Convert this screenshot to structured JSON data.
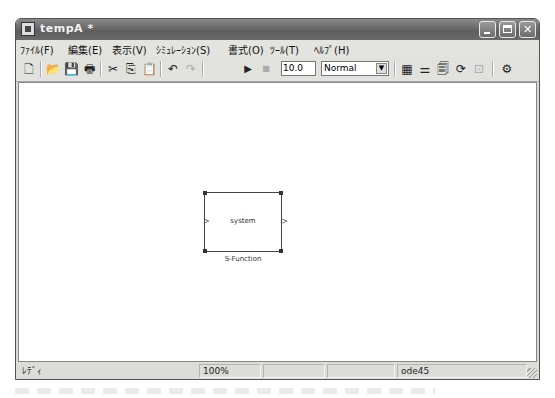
{
  "window": {
    "title": "tempA *",
    "controls": {
      "minimize": "_",
      "maximize": "□",
      "close": "✕"
    }
  },
  "menubar": {
    "items": [
      {
        "label": "ﾌｧｲﾙ(F)"
      },
      {
        "label": "編集(E)"
      },
      {
        "label": "表示(V)"
      },
      {
        "label": "ｼﾐｭﾚｰｼｮﾝ(S)"
      },
      {
        "label": "書式(O)"
      },
      {
        "label": "ﾂｰﾙ(T)"
      },
      {
        "label": "ﾍﾙﾌﾟ(H)"
      }
    ]
  },
  "toolbar": {
    "icons": {
      "new": "🗋",
      "open": "📂",
      "save": "💾",
      "print": "🖶",
      "cut": "✂",
      "copy": "⎘",
      "paste": "📋",
      "undo": "↶",
      "redo": "↷",
      "start": "▶",
      "stop": "■",
      "library": "▦",
      "model_browser": "⚌",
      "debug": "🗐",
      "update": "⟳",
      "build": "⊡",
      "explorer": "⚙"
    },
    "stop_time": "10.0",
    "simulation_mode": "Normal",
    "dropdown_arrow": "▼"
  },
  "canvas": {
    "block": {
      "label": "system",
      "name": "S-Function",
      "input_port": ">",
      "output_port": ">"
    }
  },
  "statusbar": {
    "status": "ﾚﾃﾞｨ",
    "zoom": "100%",
    "cell3": "",
    "cell4": "",
    "solver": "ode45"
  }
}
